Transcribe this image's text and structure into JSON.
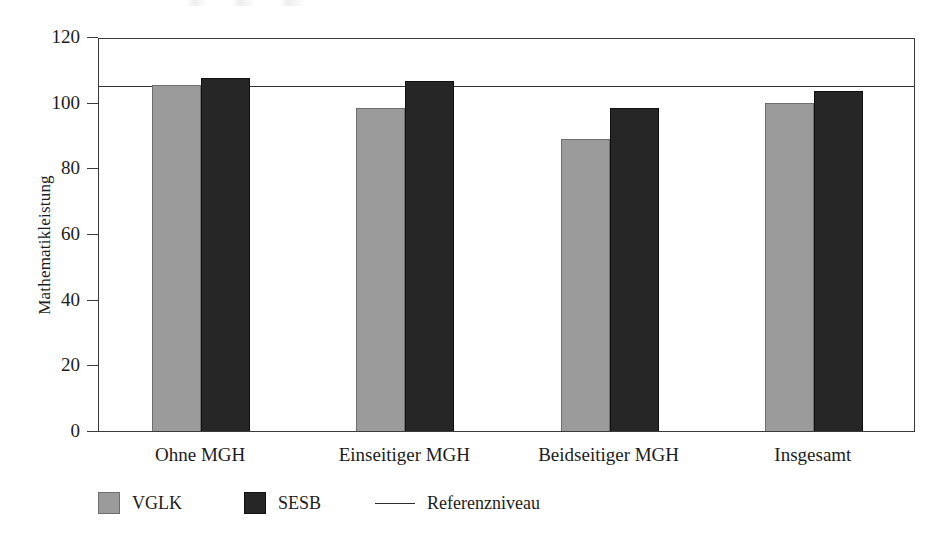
{
  "chart_data": {
    "type": "bar",
    "title": "",
    "xlabel": "",
    "ylabel": "Mathematikleistung",
    "categories": [
      "Ohne MGH",
      "Einseitiger MGH",
      "Beidseitiger MGH",
      "Insgesamt"
    ],
    "series": [
      {
        "name": "VGLK",
        "color": "#9b9b9b",
        "values": [
          105.5,
          98.3,
          89.0,
          100.0
        ]
      },
      {
        "name": "SESB",
        "color": "#262626",
        "values": [
          107.6,
          106.5,
          98.4,
          103.5
        ]
      }
    ],
    "reference_line": {
      "label": "Referenzniveau",
      "value": 105.6,
      "color": "#333333"
    },
    "ylim": [
      0,
      120
    ],
    "yticks": [
      0,
      20,
      40,
      60,
      80,
      100,
      120
    ],
    "ytick_labels": [
      "0",
      "20",
      "40",
      "60",
      "80",
      "100",
      "120"
    ],
    "grid": false,
    "legend_position": "bottom-left"
  },
  "legend": {
    "items": [
      {
        "label": "VGLK",
        "marker": "square-gray"
      },
      {
        "label": "SESB",
        "marker": "square-dark"
      },
      {
        "label": "Referenzniveau",
        "marker": "line"
      }
    ]
  }
}
